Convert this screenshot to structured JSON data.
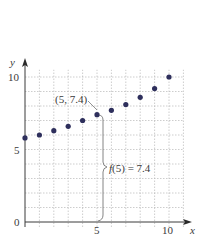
{
  "chart_data": {
    "type": "scatter",
    "title": "",
    "xlabel": "x",
    "ylabel": "y",
    "xlim": [
      0,
      10.5
    ],
    "ylim": [
      0,
      10.5
    ],
    "x_ticks": [
      "5",
      "10"
    ],
    "y_ticks": [
      "0",
      "5",
      "10"
    ],
    "grid": true,
    "grid_step": 1,
    "x": [
      0,
      1,
      2,
      3,
      4,
      5,
      6,
      7,
      8,
      9,
      10
    ],
    "values": [
      5.8,
      6.0,
      6.3,
      6.6,
      7.0,
      7.4,
      7.7,
      8.1,
      8.6,
      9.2,
      10.0
    ],
    "annotations": [
      {
        "text": "(5, 7.4)",
        "x": 5,
        "y": 7.4
      },
      {
        "text": "f(5) = 7.4",
        "x": 5,
        "y": 3.7
      }
    ],
    "colors": {
      "point": "#2e2f5c",
      "axis": "#3a3a3a",
      "grid": "#b8b8b8",
      "bracket": "#777777"
    }
  }
}
